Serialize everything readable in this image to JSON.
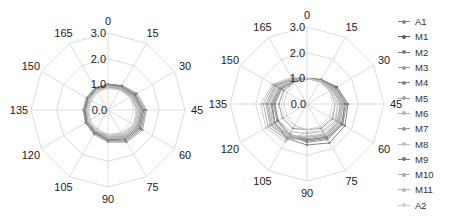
{
  "chart_data": [
    {
      "type": "radar",
      "title": "",
      "angles": [
        0,
        15,
        30,
        45,
        60,
        75,
        90,
        105,
        120,
        135,
        150,
        165
      ],
      "angle_labels": [
        "0",
        "15",
        "30",
        "45",
        "60",
        "75",
        "90",
        "105",
        "120",
        "135",
        "150",
        "165"
      ],
      "radial_ticks": [
        "0.0",
        "1.0",
        "2.0",
        "3.0"
      ],
      "rlim": [
        0,
        3.0
      ],
      "grid": true,
      "series": [
        {
          "name": "A1",
          "color": "#8a8a8a",
          "values": [
            0.9,
            0.95,
            1.05,
            1.15,
            1.2,
            1.1,
            1.0,
            0.95,
            0.9,
            0.85,
            0.85,
            0.9
          ]
        },
        {
          "name": "M1",
          "color": "#6e6e6e",
          "values": [
            0.95,
            1.0,
            1.15,
            1.3,
            1.35,
            1.25,
            1.1,
            1.0,
            0.95,
            0.9,
            0.9,
            0.95
          ]
        },
        {
          "name": "M2",
          "color": "#7c7c7c",
          "values": [
            1.0,
            1.05,
            1.2,
            1.4,
            1.45,
            1.35,
            1.2,
            1.05,
            1.0,
            0.95,
            0.95,
            1.0
          ]
        },
        {
          "name": "M3",
          "color": "#9a9a9a",
          "values": [
            1.0,
            1.1,
            1.3,
            1.5,
            1.55,
            1.45,
            1.25,
            1.1,
            1.0,
            0.95,
            0.95,
            1.0
          ]
        },
        {
          "name": "M4",
          "color": "#858585",
          "values": [
            1.0,
            1.1,
            1.25,
            1.45,
            1.5,
            1.4,
            1.2,
            1.05,
            1.0,
            0.9,
            0.9,
            0.95
          ]
        },
        {
          "name": "M5",
          "color": "#a0a0a0",
          "values": [
            0.95,
            1.0,
            1.1,
            1.25,
            1.3,
            1.2,
            1.05,
            0.95,
            0.9,
            0.85,
            0.85,
            0.9
          ]
        },
        {
          "name": "M6",
          "color": "#b0b0b0",
          "values": [
            0.9,
            0.95,
            1.05,
            1.2,
            1.25,
            1.15,
            1.0,
            0.9,
            0.85,
            0.8,
            0.8,
            0.85
          ]
        },
        {
          "name": "M7",
          "color": "#999999",
          "values": [
            0.95,
            1.0,
            1.15,
            1.35,
            1.4,
            1.3,
            1.15,
            1.0,
            0.95,
            0.9,
            0.9,
            0.95
          ]
        },
        {
          "name": "M8",
          "color": "#c2c2c2",
          "values": [
            0.85,
            0.9,
            1.0,
            1.1,
            1.15,
            1.05,
            0.95,
            0.85,
            0.8,
            0.75,
            0.75,
            0.8
          ]
        },
        {
          "name": "M9",
          "color": "#777777",
          "values": [
            1.0,
            1.05,
            1.2,
            1.35,
            1.4,
            1.3,
            1.15,
            1.0,
            0.95,
            0.9,
            0.9,
            0.95
          ]
        },
        {
          "name": "M10",
          "color": "#a8a8a8",
          "values": [
            0.9,
            0.95,
            1.1,
            1.25,
            1.3,
            1.2,
            1.05,
            0.95,
            0.9,
            0.85,
            0.85,
            0.9
          ]
        },
        {
          "name": "M11",
          "color": "#b8b8b8",
          "values": [
            0.95,
            1.0,
            1.1,
            1.3,
            1.35,
            1.25,
            1.1,
            0.95,
            0.9,
            0.85,
            0.85,
            0.9
          ]
        },
        {
          "name": "A2",
          "color": "#d0d0d0",
          "values": [
            0.85,
            0.9,
            1.0,
            1.15,
            1.2,
            1.1,
            1.0,
            0.9,
            0.85,
            0.8,
            0.8,
            0.85
          ]
        }
      ]
    },
    {
      "type": "radar",
      "title": "",
      "angles": [
        0,
        15,
        30,
        45,
        60,
        75,
        90,
        105,
        120,
        135,
        150,
        165
      ],
      "angle_labels": [
        "0",
        "15",
        "30",
        "45",
        "60",
        "75",
        "90",
        "105",
        "120",
        "135",
        "150",
        "165"
      ],
      "radial_ticks": [
        "0.0",
        "1.0",
        "2.0",
        "3.0"
      ],
      "rlim": [
        0,
        3.0
      ],
      "grid": true,
      "series": [
        {
          "name": "A1",
          "color": "#8a8a8a",
          "values": [
            1.0,
            1.0,
            1.05,
            1.1,
            1.15,
            1.1,
            1.0,
            1.1,
            1.1,
            1.1,
            1.05,
            1.0
          ]
        },
        {
          "name": "M1",
          "color": "#6e6e6e",
          "values": [
            1.0,
            1.1,
            1.35,
            1.6,
            1.7,
            1.75,
            1.6,
            1.55,
            1.45,
            1.35,
            1.2,
            1.05
          ]
        },
        {
          "name": "M2",
          "color": "#7c7c7c",
          "values": [
            1.0,
            1.05,
            1.25,
            1.45,
            1.6,
            1.55,
            1.45,
            1.45,
            1.45,
            1.4,
            1.25,
            1.05
          ]
        },
        {
          "name": "M3",
          "color": "#9a9a9a",
          "values": [
            1.0,
            1.05,
            1.2,
            1.35,
            1.45,
            1.45,
            1.35,
            1.5,
            1.6,
            1.55,
            1.4,
            1.1
          ]
        },
        {
          "name": "M4",
          "color": "#858585",
          "values": [
            1.0,
            1.1,
            1.3,
            1.55,
            1.6,
            1.6,
            1.5,
            1.4,
            1.35,
            1.3,
            1.2,
            1.05
          ]
        },
        {
          "name": "M5",
          "color": "#a0a0a0",
          "values": [
            1.0,
            1.05,
            1.15,
            1.3,
            1.4,
            1.4,
            1.3,
            1.6,
            1.75,
            1.7,
            1.5,
            1.15
          ]
        },
        {
          "name": "M6",
          "color": "#b0b0b0",
          "values": [
            1.0,
            1.0,
            1.1,
            1.2,
            1.3,
            1.25,
            1.15,
            1.25,
            1.3,
            1.3,
            1.2,
            1.05
          ]
        },
        {
          "name": "M7",
          "color": "#999999",
          "values": [
            1.0,
            1.05,
            1.2,
            1.4,
            1.5,
            1.5,
            1.4,
            1.55,
            1.65,
            1.6,
            1.45,
            1.1
          ]
        },
        {
          "name": "M8",
          "color": "#c2c2c2",
          "values": [
            1.0,
            1.0,
            1.1,
            1.2,
            1.25,
            1.2,
            1.1,
            1.7,
            1.85,
            1.8,
            1.55,
            1.2
          ]
        },
        {
          "name": "M9",
          "color": "#777777",
          "values": [
            1.0,
            1.1,
            1.3,
            1.5,
            1.55,
            1.5,
            1.4,
            1.35,
            1.3,
            1.25,
            1.15,
            1.0
          ]
        },
        {
          "name": "M10",
          "color": "#a8a8a8",
          "values": [
            1.0,
            1.05,
            1.15,
            1.3,
            1.35,
            1.35,
            1.25,
            1.45,
            1.55,
            1.5,
            1.35,
            1.1
          ]
        },
        {
          "name": "M11",
          "color": "#b8b8b8",
          "values": [
            1.0,
            1.05,
            1.2,
            1.35,
            1.45,
            1.4,
            1.3,
            1.4,
            1.5,
            1.45,
            1.3,
            1.05
          ]
        },
        {
          "name": "A2",
          "color": "#d0d0d0",
          "values": [
            1.0,
            1.0,
            1.05,
            1.1,
            1.1,
            1.05,
            1.0,
            0.95,
            0.9,
            0.9,
            0.9,
            0.95
          ]
        }
      ]
    }
  ],
  "legend": [
    {
      "label": "A1",
      "color": "#8a8a8a"
    },
    {
      "label": "M1",
      "color": "#5e5e5e"
    },
    {
      "label": "M2",
      "color": "#7c7c7c"
    },
    {
      "label": "M3",
      "color": "#9a9a9a"
    },
    {
      "label": "M4",
      "color": "#858585"
    },
    {
      "label": "M5",
      "color": "#a0a0a0"
    },
    {
      "label": "M6",
      "color": "#b0b0b0"
    },
    {
      "label": "M7",
      "color": "#999999"
    },
    {
      "label": "M8",
      "color": "#c2c2c2"
    },
    {
      "label": "M9",
      "color": "#777777"
    },
    {
      "label": "M10",
      "color": "#a8a8a8"
    },
    {
      "label": "M11",
      "color": "#b8b8b8"
    },
    {
      "label": "A2",
      "color": "#d0d0d0"
    }
  ]
}
